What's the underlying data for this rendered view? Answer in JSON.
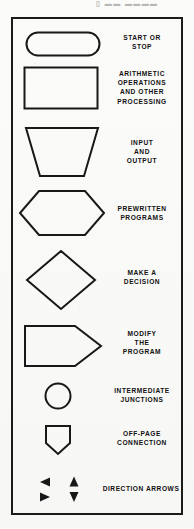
{
  "page": {
    "top_partial_text": "▯ ▬▬ ▬▬▬▬",
    "panel_title": ""
  },
  "legend": {
    "title": "Flowchart symbol legend",
    "ink_color": "#181818",
    "paper_color": "#fbfbfa",
    "items": [
      {
        "id": "terminal",
        "shape": "stadium",
        "icon_name": "start-stop-terminal-shape",
        "label": "START OR\nSTOP"
      },
      {
        "id": "process",
        "shape": "rectangle",
        "icon_name": "process-rectangle-shape",
        "label": "ARITHMETIC\nOPERATIONS\nAND OTHER\nPROCESSING"
      },
      {
        "id": "input-output",
        "shape": "inverted-trapezoid",
        "icon_name": "input-output-trapezoid-shape",
        "label": "INPUT\nAND\nOUTPUT"
      },
      {
        "id": "predefined-process",
        "shape": "hexagon",
        "icon_name": "prewritten-programs-hexagon-shape",
        "label": "PREWRITTEN\nPROGRAMS"
      },
      {
        "id": "decision",
        "shape": "diamond",
        "icon_name": "decision-diamond-shape",
        "label": "MAKE A\nDECISION"
      },
      {
        "id": "modify",
        "shape": "pentagon-right",
        "icon_name": "modify-program-pentagon-shape",
        "label": "MODIFY\nTHE\nPROGRAM"
      },
      {
        "id": "connector",
        "shape": "circle",
        "icon_name": "intermediate-junction-circle-shape",
        "label": "INTERMEDIATE\nJUNCTIONS"
      },
      {
        "id": "off-page-connector",
        "shape": "home-plate-down",
        "icon_name": "off-page-connection-pentagon-shape",
        "label": "OFF-PAGE\nCONNECTION"
      },
      {
        "id": "direction-arrows",
        "shape": "arrow-cluster",
        "icon_name": "direction-arrows-cluster",
        "label": "DIRECTION ARROWS",
        "arrows": [
          {
            "dir": "left",
            "icon_name": "arrow-left-icon"
          },
          {
            "dir": "up",
            "icon_name": "arrow-up-icon"
          },
          {
            "dir": "right",
            "icon_name": "arrow-right-icon"
          },
          {
            "dir": "down",
            "icon_name": "arrow-down-icon"
          }
        ]
      }
    ]
  }
}
